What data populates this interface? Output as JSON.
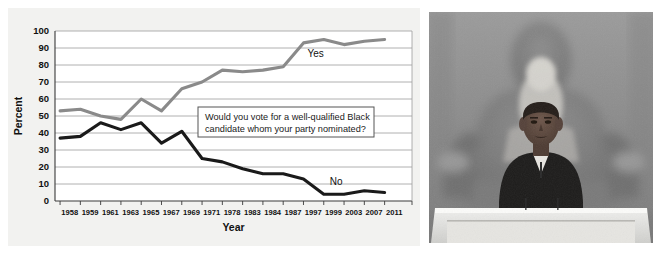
{
  "figure": {
    "left_panel_name": "line-chart",
    "right_panel_name": "photograph"
  },
  "chart_data": {
    "type": "line",
    "title": "",
    "xlabel": "Year",
    "ylabel": "Percent",
    "ylim": [
      0,
      100
    ],
    "ytick_step": 10,
    "yticks": [
      "0",
      "10",
      "20",
      "30",
      "40",
      "50",
      "60",
      "70",
      "80",
      "90",
      "100"
    ],
    "grid": true,
    "legend_position": "inline-right",
    "categories": [
      "1958",
      "1959",
      "1961",
      "1963",
      "1965",
      "1967",
      "1969",
      "1971",
      "1978",
      "1983",
      "1984",
      "1987",
      "1997",
      "1999",
      "2003",
      "2007",
      "2011"
    ],
    "annotation": "Would you vote for a well-qualified Black candidate whom your party nominated?",
    "series": [
      {
        "name": "Yes",
        "color": "#8a8a8a",
        "label": "Yes",
        "values": [
          53,
          54,
          50,
          48,
          60,
          53,
          66,
          70,
          77,
          76,
          77,
          79,
          93,
          95,
          92,
          94,
          95
        ]
      },
      {
        "name": "No",
        "color": "#1a1a1a",
        "label": "No",
        "values": [
          37,
          38,
          46,
          42,
          46,
          34,
          41,
          25,
          23,
          19,
          16,
          16,
          13,
          4,
          4,
          6,
          5
        ]
      }
    ]
  },
  "photo": {
    "caption": "",
    "alt_name": "obama-at-lincoln-memorial-photo"
  }
}
